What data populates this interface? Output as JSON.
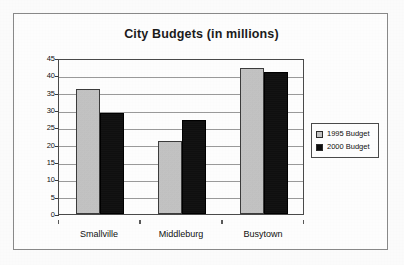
{
  "figure": {
    "title": "City Budgets (in millions)"
  },
  "legend": {
    "position": "right",
    "entries": [
      {
        "label": "1995 Budget",
        "swatch_name": "legend-swatch-1995",
        "color": "#c9c9c9"
      },
      {
        "label": "2000 Budget",
        "swatch_name": "legend-swatch-2000",
        "color": "#0d0d0d"
      }
    ]
  },
  "axes": {
    "y_ticks": [
      "45",
      "40",
      "35",
      "30",
      "25",
      "20",
      "15",
      "10",
      "5",
      "0"
    ],
    "x_ticks": [
      "Smallville",
      "Middleburg",
      "Busytown"
    ]
  },
  "chart_data": {
    "type": "bar",
    "title": "City Budgets (in millions)",
    "xlabel": "",
    "ylabel": "",
    "ylim": [
      0,
      45
    ],
    "ytick_step": 5,
    "grid": true,
    "legend_position": "right",
    "categories": [
      "Smallville",
      "Middleburg",
      "Busytown"
    ],
    "series": [
      {
        "name": "1995 Budget",
        "color": "#c9c9c9",
        "values": [
          36,
          21,
          42
        ]
      },
      {
        "name": "2000 Budget",
        "color": "#0d0d0d",
        "values": [
          29,
          27,
          41
        ]
      }
    ]
  }
}
